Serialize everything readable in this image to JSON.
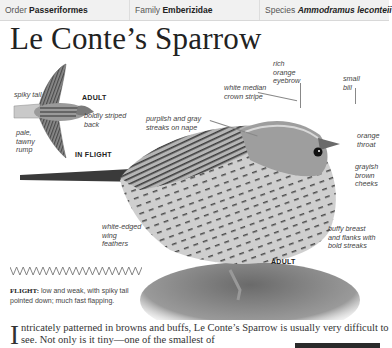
{
  "header": {
    "order_label": "Order",
    "order_value": "Passeriformes",
    "family_label": "Family",
    "family_value": "Emberizidae",
    "species_label": "Species",
    "species_value": "Ammodramus leconteii"
  },
  "title": "Le Conte’s Sparrow",
  "flight_illustration": {
    "labels": {
      "spiky_tail": "spiky tail",
      "adult": "ADULT",
      "boldly_striped_back": "boldly striped back",
      "pale_tawny_rump": "pale, tawny rump",
      "in_flight": "IN FLIGHT"
    }
  },
  "main_illustration": {
    "labels": {
      "white_median_crown_stripe": "white median crown stripe",
      "purplish_gray_streaks": "purplish and gray streaks on nape",
      "rich_orange_eyebrow": "rich orange eyebrow",
      "small_bill": "small bill",
      "orange_throat": "orange throat",
      "grayish_brown_cheeks": "grayish brown cheeks",
      "buffy_breast": "buffy breast and flanks with bold streaks",
      "white_edged_wing": "white-edged wing feathers",
      "adult": "ADULT"
    }
  },
  "flight": {
    "label": "FLIGHT:",
    "text": "low and weak, with spiky tail pointed down; much fast flapping."
  },
  "body_text": {
    "dropcap": "I",
    "text": "ntricately patterned in browns and buffs, Le Conte’s Sparrow is usually very difficult to see. Not only is it tiny—one of the smallest of"
  }
}
